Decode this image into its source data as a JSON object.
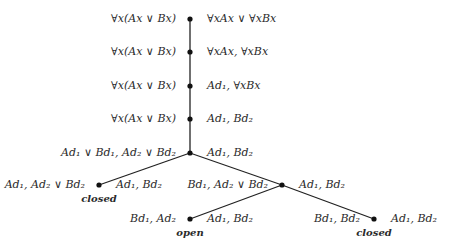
{
  "diagram": {
    "type": "tableau-tree",
    "edge_color": "#222222",
    "node_color": "#111111",
    "nodes": [
      {
        "id": "n1",
        "x": 190,
        "y": 19,
        "left": "∀x(Ax ∨ Bx)",
        "right": "∀xAx ∨ ∀xBx"
      },
      {
        "id": "n2",
        "x": 190,
        "y": 52,
        "left": "∀x(Ax ∨ Bx)",
        "right": "∀xAx, ∀xBx"
      },
      {
        "id": "n3",
        "x": 190,
        "y": 86,
        "left": "∀x(Ax ∨ Bx)",
        "right": "Ad₁, ∀xBx"
      },
      {
        "id": "n4",
        "x": 190,
        "y": 119,
        "left": "∀x(Ax ∨ Bx)",
        "right": "Ad₁, Bd₂"
      },
      {
        "id": "n5",
        "x": 190,
        "y": 153,
        "left": "Ad₁ ∨ Bd₁, Ad₂ ∨ Bd₂",
        "right": "Ad₁, Bd₂"
      },
      {
        "id": "n6",
        "x": 99,
        "y": 185,
        "left": "Ad₁, Ad₂ ∨ Bd₂",
        "right": "Ad₁, Bd₂",
        "status": "closed"
      },
      {
        "id": "n7",
        "x": 282,
        "y": 185,
        "left": "Bd₁, Ad₂ ∨ Bd₂",
        "right": "Ad₁, Bd₂"
      },
      {
        "id": "n8",
        "x": 190,
        "y": 219,
        "left": "Bd₁, Ad₂",
        "right": "Ad₁, Bd₂",
        "status": "open"
      },
      {
        "id": "n9",
        "x": 374,
        "y": 219,
        "left": "Bd₁, Bd₂",
        "right": "Ad₁, Bd₂",
        "status": "closed"
      }
    ],
    "edges": [
      [
        "n1",
        "n2"
      ],
      [
        "n2",
        "n3"
      ],
      [
        "n3",
        "n4"
      ],
      [
        "n4",
        "n5"
      ],
      [
        "n5",
        "n6"
      ],
      [
        "n5",
        "n7"
      ],
      [
        "n7",
        "n8"
      ],
      [
        "n7",
        "n9"
      ]
    ]
  }
}
